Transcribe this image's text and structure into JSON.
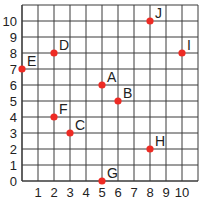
{
  "chart_data": {
    "type": "scatter",
    "title": "",
    "xlabel": "",
    "ylabel": "",
    "xlim": [
      0,
      11
    ],
    "ylim": [
      0,
      10.8
    ],
    "grid": true,
    "x_ticks": [
      "1",
      "2",
      "3",
      "4",
      "5",
      "6",
      "7",
      "8",
      "9",
      "10"
    ],
    "y_ticks": [
      "0",
      "1",
      "2",
      "3",
      "4",
      "5",
      "6",
      "7",
      "8",
      "9",
      "10"
    ],
    "point_color": "#ee2b24",
    "grid_color": "#3a3a3a",
    "points": [
      {
        "label": "A",
        "x": 5,
        "y": 6
      },
      {
        "label": "B",
        "x": 6,
        "y": 5
      },
      {
        "label": "C",
        "x": 3,
        "y": 3
      },
      {
        "label": "D",
        "x": 2,
        "y": 8
      },
      {
        "label": "E",
        "x": 0,
        "y": 7
      },
      {
        "label": "F",
        "x": 2,
        "y": 4
      },
      {
        "label": "G",
        "x": 5,
        "y": 0
      },
      {
        "label": "H",
        "x": 8,
        "y": 2
      },
      {
        "label": "I",
        "x": 10,
        "y": 8
      },
      {
        "label": "J",
        "x": 8,
        "y": 10
      }
    ]
  }
}
